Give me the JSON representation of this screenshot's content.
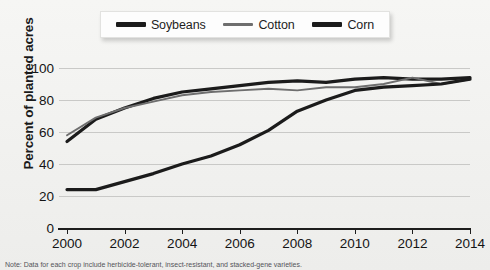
{
  "chart_data": {
    "type": "line",
    "title": "",
    "xlabel": "",
    "ylabel": "Percent of planted acres",
    "xlim": [
      2000,
      2014
    ],
    "ylim": [
      0,
      100
    ],
    "grid": true,
    "legend_position": "top-center",
    "x": [
      2000,
      2001,
      2002,
      2003,
      2004,
      2005,
      2006,
      2007,
      2008,
      2009,
      2010,
      2011,
      2012,
      2013,
      2014
    ],
    "series": [
      {
        "name": "Soybeans",
        "color": "#1b1b1b",
        "width": "thick",
        "values": [
          54,
          68,
          75,
          81,
          85,
          87,
          89,
          91,
          92,
          91,
          93,
          94,
          93,
          93,
          94
        ]
      },
      {
        "name": "Cotton",
        "color": "#6e6e6e",
        "width": "thin",
        "values": [
          58,
          69,
          75,
          79,
          83,
          85,
          86,
          87,
          86,
          88,
          88,
          90,
          94,
          90,
          93
        ]
      },
      {
        "name": "Corn",
        "color": "#1b1b1b",
        "width": "thick",
        "values": [
          24,
          24,
          29,
          34,
          40,
          45,
          52,
          61,
          73,
          80,
          86,
          88,
          89,
          90,
          93
        ]
      }
    ],
    "y_ticks": [
      0,
      20,
      40,
      60,
      80,
      100
    ],
    "x_ticks": [
      2000,
      2002,
      2004,
      2006,
      2008,
      2010,
      2012,
      2014
    ]
  },
  "legend": {
    "items": [
      {
        "label": "Soybeans",
        "swatch": "thick-line-swatch"
      },
      {
        "label": "Cotton",
        "swatch": "thin-line-swatch"
      },
      {
        "label": "Corn",
        "swatch": "thick-line-swatch"
      }
    ]
  },
  "axes": {
    "y_title": "Percent of planted acres",
    "y_tick_labels": [
      "100",
      "80",
      "60",
      "40",
      "20",
      "0"
    ],
    "x_tick_labels": [
      "2000",
      "2002",
      "2004",
      "2006",
      "2008",
      "2010",
      "2012",
      "2014"
    ]
  },
  "caption": "Note: Data for each crop include herbicide-tolerant, insect-resistant, and stacked-gene varieties."
}
